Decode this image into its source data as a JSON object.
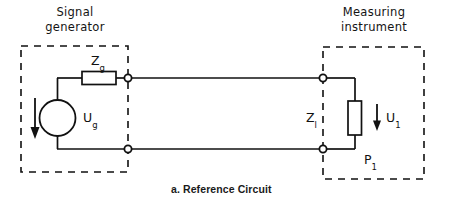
{
  "figure": {
    "caption": "a. Reference Circuit",
    "background_color": "#ffffff",
    "line_color": "#111111"
  },
  "blocks": [
    {
      "id": "signal-generator",
      "title_line_1": "Signal",
      "title_line_2": "generator",
      "border_style": "dashed"
    },
    {
      "id": "measuring-instrument",
      "title_line_1": "Measuring",
      "title_line_2": "instrument",
      "border_style": "dashed"
    }
  ],
  "components": {
    "source_impedance": {
      "label": "Z",
      "subscript": "g",
      "type": "resistor-horizontal"
    },
    "source": {
      "label": "U",
      "subscript": "g",
      "type": "voltage-source-circle"
    },
    "load_impedance": {
      "label": "Z",
      "subscript": "l",
      "type": "resistor-vertical"
    },
    "load_voltage": {
      "label": "U",
      "subscript": "1",
      "type": "arrow-down"
    },
    "load_power": {
      "label": "P",
      "subscript": "1",
      "type": "annotation"
    }
  },
  "nodes": [
    {
      "id": "gen-terminal-top",
      "type": "terminal-node"
    },
    {
      "id": "gen-terminal-bottom",
      "type": "terminal-node"
    },
    {
      "id": "inst-terminal-top",
      "type": "terminal-node"
    },
    {
      "id": "inst-terminal-bottom",
      "type": "terminal-node"
    }
  ]
}
